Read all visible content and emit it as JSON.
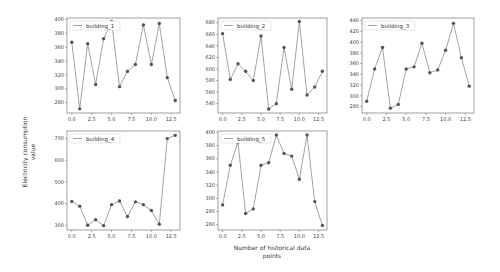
{
  "figure": {
    "ylabel_line1": "Electricity consumption",
    "ylabel_line2": "value",
    "xlabel_line1": "Number of historical data",
    "xlabel_line2": "points",
    "line_color": "#8a8a8a",
    "marker_color": "#555555",
    "frame_color": "#888888"
  },
  "chart_data": [
    {
      "type": "line",
      "title": "",
      "legend": "building_1",
      "x": [
        0,
        1,
        2,
        3,
        4,
        5,
        6,
        7,
        8,
        9,
        10,
        11,
        12,
        13
      ],
      "values": [
        367,
        271,
        365,
        306,
        372,
        397,
        303,
        325,
        335,
        392,
        335,
        394,
        316,
        283
      ],
      "ylim": [
        265,
        402
      ],
      "yticks": [
        280,
        300,
        320,
        340,
        360,
        380,
        400
      ],
      "xticks": [
        "0.0",
        "2.5",
        "5.0",
        "7.5",
        "10.0",
        "12.5"
      ],
      "xlim": [
        -0.6,
        13.6
      ]
    },
    {
      "type": "line",
      "title": "",
      "legend": "building_2",
      "x": [
        0,
        1,
        2,
        3,
        4,
        5,
        6,
        7,
        8,
        9,
        10,
        11,
        12,
        13
      ],
      "values": [
        661,
        582,
        609,
        596,
        580,
        657,
        531,
        540,
        637,
        565,
        682,
        555,
        569,
        596
      ],
      "ylim": [
        524,
        688
      ],
      "yticks": [
        540,
        560,
        580,
        600,
        620,
        640,
        660,
        680
      ],
      "xticks": [
        "0.0",
        "2.5",
        "5.0",
        "7.5",
        "10.0",
        "12.5"
      ],
      "xlim": [
        -0.6,
        13.6
      ]
    },
    {
      "type": "line",
      "title": "",
      "legend": "building_3",
      "x": [
        0,
        1,
        2,
        3,
        4,
        5,
        6,
        7,
        8,
        9,
        10,
        11,
        12,
        13
      ],
      "values": [
        290,
        350,
        390,
        277,
        284,
        350,
        354,
        398,
        343,
        348,
        385,
        435,
        371,
        318
      ],
      "ylim": [
        268,
        445
      ],
      "yticks": [
        280,
        300,
        320,
        340,
        360,
        380,
        400,
        420,
        440
      ],
      "xticks": [
        "0.0",
        "2.5",
        "5.0",
        "7.5",
        "10.0",
        "12.5"
      ],
      "xlim": [
        -0.6,
        13.6
      ]
    },
    {
      "type": "line",
      "title": "",
      "legend": "building_4",
      "x": [
        0,
        1,
        2,
        3,
        4,
        5,
        6,
        7,
        8,
        9,
        10,
        11,
        12,
        13
      ],
      "values": [
        410,
        388,
        300,
        325,
        298,
        395,
        412,
        340,
        408,
        395,
        368,
        305,
        700,
        715
      ],
      "ylim": [
        278,
        735
      ],
      "yticks": [
        300,
        400,
        500,
        600,
        700
      ],
      "xticks": [
        "0.0",
        "2.5",
        "5.0",
        "7.5",
        "10.0",
        "12.5"
      ],
      "xlim": [
        -0.6,
        13.6
      ]
    },
    {
      "type": "line",
      "title": "",
      "legend": "building_5",
      "x": [
        0,
        1,
        2,
        3,
        4,
        5,
        6,
        7,
        8,
        9,
        10,
        11,
        12,
        13
      ],
      "values": [
        290,
        350,
        385,
        277,
        284,
        350,
        354,
        396,
        368,
        364,
        329,
        396,
        295,
        259
      ],
      "ylim": [
        252,
        402
      ],
      "yticks": [
        260,
        280,
        300,
        320,
        340,
        360,
        380,
        400
      ],
      "xticks": [
        "0.0",
        "2.5",
        "5.0",
        "7.5",
        "10.0",
        "12.5"
      ],
      "xlim": [
        -0.6,
        13.6
      ]
    }
  ],
  "layout": {
    "panels": [
      {
        "x": 67,
        "y": 18,
        "w": 113,
        "h": 95
      },
      {
        "x": 218,
        "y": 18,
        "w": 109,
        "h": 95
      },
      {
        "x": 362,
        "y": 18,
        "w": 112,
        "h": 95
      },
      {
        "x": 67,
        "y": 131,
        "w": 113,
        "h": 99
      },
      {
        "x": 218,
        "y": 131,
        "w": 109,
        "h": 99
      }
    ]
  }
}
